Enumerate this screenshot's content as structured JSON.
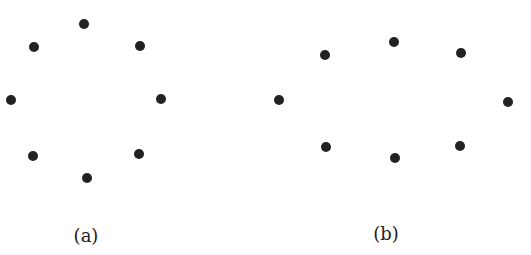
{
  "panels": [
    {
      "label": "(a)",
      "label_pos": [
        86,
        235
      ],
      "points": [
        [
          84,
          24
        ],
        [
          34,
          47
        ],
        [
          140,
          46
        ],
        [
          11,
          100
        ],
        [
          161,
          99
        ],
        [
          33,
          156
        ],
        [
          139,
          154
        ],
        [
          87,
          178
        ]
      ]
    },
    {
      "label": "(b)",
      "label_pos": [
        386,
        233
      ],
      "points": [
        [
          394,
          42
        ],
        [
          325,
          55
        ],
        [
          461,
          53
        ],
        [
          279,
          100
        ],
        [
          508,
          102
        ],
        [
          326,
          147
        ],
        [
          460,
          146
        ],
        [
          395,
          158
        ]
      ]
    }
  ],
  "colors": {
    "dot": "#222222",
    "background": "#ffffff"
  }
}
